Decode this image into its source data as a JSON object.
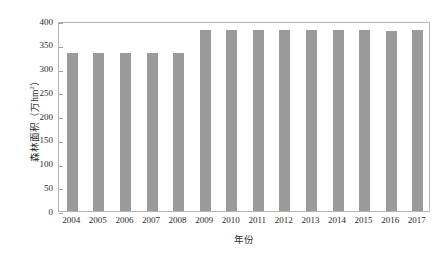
{
  "chart_data": {
    "type": "bar",
    "title": "",
    "xlabel": "年份",
    "ylabel": "森林面积（万hm",
    "ylabel_superscript": "2",
    "ylabel_suffix": "）",
    "categories": [
      "2004",
      "2005",
      "2006",
      "2007",
      "2008",
      "2009",
      "2010",
      "2011",
      "2012",
      "2013",
      "2014",
      "2015",
      "2016",
      "2017"
    ],
    "values": [
      332,
      332,
      332,
      332,
      332,
      381,
      381,
      381,
      381,
      381,
      381,
      381,
      380,
      381
    ],
    "ylim": [
      0,
      400
    ],
    "yticks": [
      "400",
      "350",
      "300",
      "250",
      "200",
      "150",
      "100",
      "50",
      "0"
    ],
    "ytick_values": [
      400,
      350,
      300,
      250,
      200,
      150,
      100,
      50,
      0
    ],
    "grid": false,
    "legend": "none",
    "bar_color": "#9a9a9a",
    "axis_color": "#b4b4b4",
    "text_color": "#2b2b2b",
    "background": "#ffffff"
  }
}
